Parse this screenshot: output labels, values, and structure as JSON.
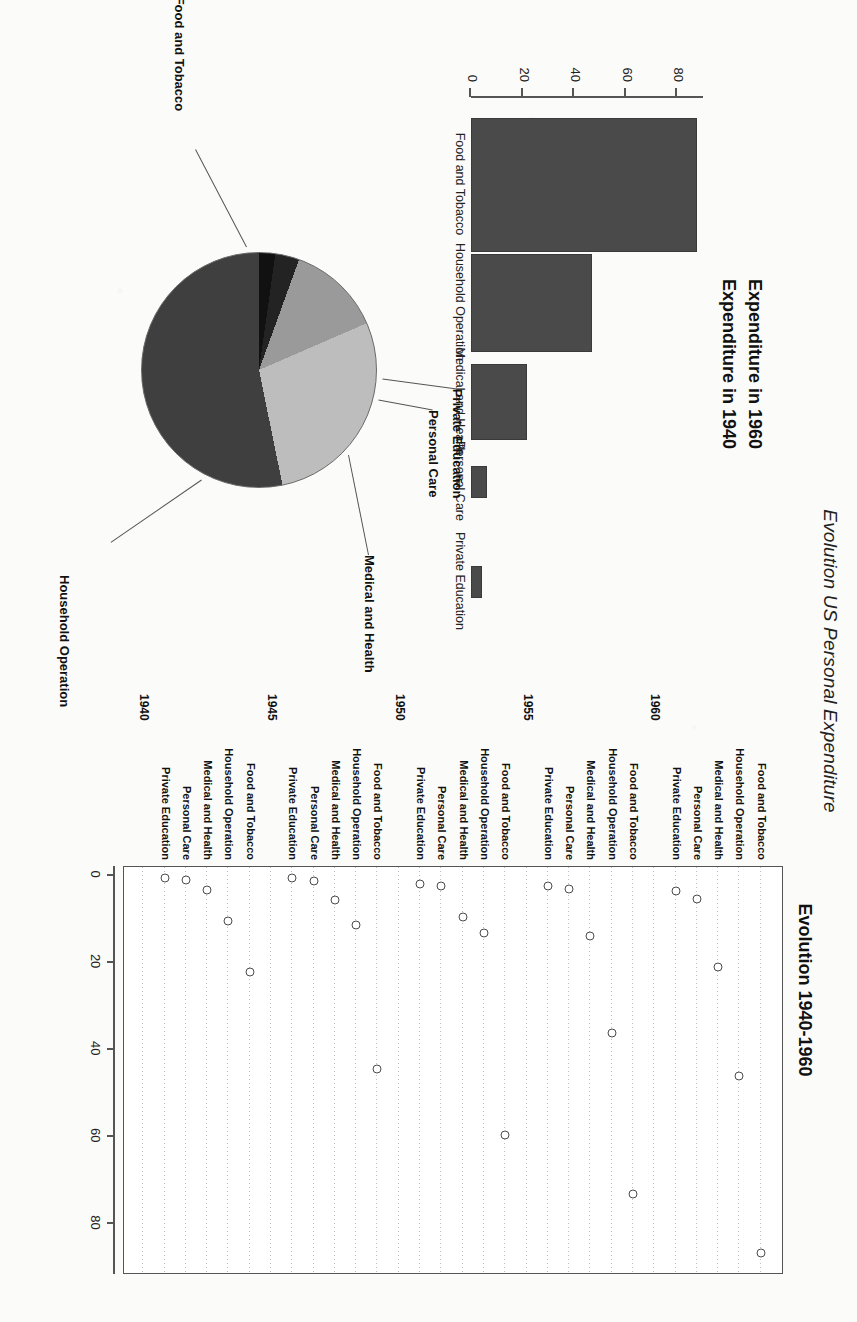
{
  "figure": {
    "main_title": "Evolution US Personal Expenditure"
  },
  "barplot": {
    "title_top": "Expenditure  in 1960",
    "title_bottom": "Expenditure in 1940",
    "categories": [
      "Food and Tobacco",
      "Household Operation",
      "Medical and Health",
      "Personal Care",
      "Private Education"
    ],
    "axis_ticks": [
      "0",
      "20",
      "40",
      "60",
      "80"
    ]
  },
  "dotplot": {
    "title": "Evolution 1940-1960",
    "groups": [
      "1940",
      "1945",
      "1950",
      "1955",
      "1960"
    ],
    "categories": [
      "Private Education",
      "Personal Care",
      "Medical and Health",
      "Household Operation",
      "Food and Tobacco"
    ],
    "axis_ticks": [
      "0",
      "20",
      "40",
      "60",
      "80"
    ]
  },
  "pie": {
    "labels": [
      "Food and Tobacco",
      "Household Operation",
      "Medical and Health",
      "Personal Care",
      "Private Education"
    ],
    "colors": [
      "#3f3f3f",
      "#bdbdbd",
      "#9a9a9a",
      "#232323",
      "#111111"
    ]
  },
  "chart_data": [
    {
      "type": "bar",
      "id": "expenditure-1960-barplot",
      "title": "Expenditure  in 1960",
      "subtitle": "Expenditure in 1940",
      "categories": [
        "Food and Tobacco",
        "Household Operation",
        "Medical and Health",
        "Personal Care",
        "Private Education"
      ],
      "values": [
        86.8,
        46.2,
        21.1,
        5.4,
        3.64
      ],
      "xlabel": "",
      "ylabel": "",
      "ylim": [
        0,
        90
      ],
      "yticks": [
        0,
        20,
        40,
        60,
        80
      ],
      "orientation": "vertical",
      "bar_color": "#4a4a4a",
      "grid": false
    },
    {
      "type": "scatter",
      "id": "evolution-1940-1960-dotplot",
      "title": "Evolution 1940-1960",
      "xlabel": "",
      "ylabel": "",
      "xlim": [
        0,
        90
      ],
      "xticks": [
        0,
        20,
        40,
        60,
        80
      ],
      "grid": true,
      "grid_style": "dotted-horizontal",
      "legend": "none",
      "groups": [
        {
          "name": "1940",
          "categories": [
            "Private Education",
            "Personal Care",
            "Medical and Health",
            "Household Operation",
            "Food and Tobacco"
          ],
          "values": [
            0.61,
            1.2,
            3.53,
            10.5,
            22.2
          ]
        },
        {
          "name": "1945",
          "categories": [
            "Private Education",
            "Personal Care",
            "Medical and Health",
            "Household Operation",
            "Food and Tobacco"
          ],
          "values": [
            0.68,
            1.4,
            5.76,
            11.5,
            44.5
          ]
        },
        {
          "name": "1950",
          "categories": [
            "Private Education",
            "Personal Care",
            "Medical and Health",
            "Household Operation",
            "Food and Tobacco"
          ],
          "values": [
            2.0,
            2.6,
            9.71,
            13.4,
            59.6
          ]
        },
        {
          "name": "1955",
          "categories": [
            "Private Education",
            "Personal Care",
            "Medical and Health",
            "Household Operation",
            "Food and Tobacco"
          ],
          "values": [
            2.5,
            3.2,
            14.0,
            36.2,
            73.2
          ]
        },
        {
          "name": "1960",
          "categories": [
            "Private Education",
            "Personal Care",
            "Medical and Health",
            "Household Operation",
            "Food and Tobacco"
          ],
          "values": [
            3.64,
            5.4,
            21.1,
            46.2,
            86.8
          ]
        }
      ]
    },
    {
      "type": "pie",
      "id": "expenditure-pie",
      "title": "",
      "labels": [
        "Food and Tobacco",
        "Household Operation",
        "Medical and Health",
        "Personal Care",
        "Private Education"
      ],
      "values": [
        86.8,
        46.2,
        21.1,
        5.4,
        3.64
      ],
      "percentages": [
        53.4,
        28.4,
        13.0,
        3.3,
        2.2
      ],
      "colors": [
        "#3f3f3f",
        "#bdbdbd",
        "#9a9a9a",
        "#232323",
        "#111111"
      ]
    }
  ]
}
